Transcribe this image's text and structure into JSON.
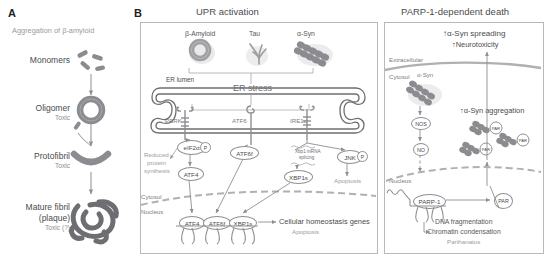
{
  "figure": {
    "panels": [
      {
        "letter": "A",
        "title": "Aggregation of β-amyloid",
        "stages": [
          {
            "name": "Monomers",
            "note": "",
            "icon": "monomer-rods-icon"
          },
          {
            "name": "Oligomer",
            "note": "Toxic",
            "icon": "oligomer-ring-icon"
          },
          {
            "name": "Protofibril",
            "note": "Toxic",
            "icon": "protofibril-arc-icon"
          },
          {
            "name": "Mature fibril",
            "name2": "(plaque)",
            "note": "Toxic (?)",
            "icon": "mature-fibril-tangle-icon"
          }
        ]
      },
      {
        "letter": "B",
        "titles": {
          "left": "UPR activation",
          "right": "PARP-1-dependent death"
        }
      }
    ],
    "upr": {
      "ligands": [
        {
          "label": "β-Amyloid",
          "icon": "beta-amyloid-ring-icon"
        },
        {
          "label": "Tau",
          "icon": "tau-tangle-icon"
        },
        {
          "label": "α-Syn",
          "icon": "alpha-syn-fibril-icon"
        }
      ],
      "er_lumen_label": "ER lumen",
      "er_stress_label": "ER stress",
      "sensors": [
        {
          "label": "PERK",
          "icon": "perk-receptor-icon"
        },
        {
          "label": "ATF6",
          "icon": "atf6-receptor-icon"
        },
        {
          "label": "IRE1α",
          "icon": "ire1a-receptor-icon"
        }
      ],
      "perk_branch": {
        "eif2a": "eIF2α",
        "phospho": "P",
        "reduced": "Reduced\nprotein\nsynthesis",
        "reduced_l1": "Reduced",
        "reduced_l2": "protein",
        "reduced_l3": "synthesis",
        "atf4": "ATF4"
      },
      "atf6_branch": {
        "atf6f": "ATF6f"
      },
      "ire1_branch": {
        "splicing": "Xbp1 mRNA\nsplicing",
        "splicing_l1": "Xbp1 mRNA",
        "splicing_l2": "splicing",
        "xbp1s": "XBP1s",
        "jnk": "JNK",
        "phospho": "P",
        "apoptosis": "Apoptosis"
      },
      "compartments": {
        "cytosol": "Cytosol",
        "nucleus": "Nucleus"
      },
      "nuclear_tfs": [
        "ATF4",
        "ATF6f",
        "XBP1s"
      ],
      "outcomes": {
        "genes": "Cellular homeostasis genes",
        "apoptosis": "Apoptosis"
      }
    },
    "parp": {
      "spreading": "↑α-Syn spreading",
      "neurotoxicity": "↑Neurotoxicity",
      "extracellular": "Extracellular",
      "cytosol": "Cytosol",
      "asyn_label": "α-Syn",
      "asyn_icon": "alpha-syn-fibril-icon",
      "nos": "NOS",
      "no": "NO",
      "aggregation": "↑α-Syn aggregation",
      "par_tags": [
        "PAR",
        "PAR",
        "PAR"
      ],
      "nucleus": "Nucleus",
      "parp1": "PARP-1",
      "par": "PAR",
      "effects_l1": "DNA fragmentation",
      "effects_l2": "Chromatin condensation",
      "effects_l3": "Parthanatos"
    },
    "colors": {
      "text_dark": "#4b4b4d",
      "text_gray": "#9b9b9e",
      "line": "#8f8f93",
      "border": "#b9b9bc",
      "fibril": "#8c8c90"
    }
  }
}
